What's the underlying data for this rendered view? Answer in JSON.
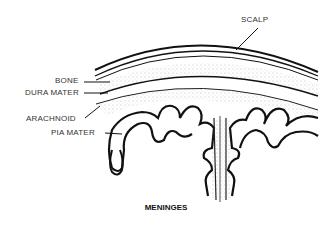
{
  "diagram": {
    "caption": "MENINGES",
    "labels": {
      "scalp": "SCALP",
      "bone": "BONE",
      "dura_mater": "DURA MATER",
      "arachnoid": "ARACHNOID",
      "pia_mater": "PIA MATER"
    }
  }
}
